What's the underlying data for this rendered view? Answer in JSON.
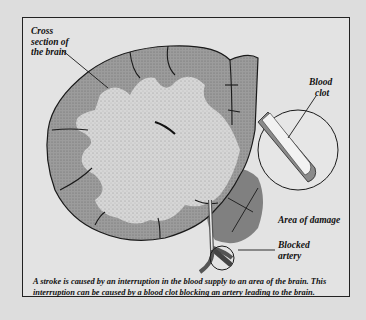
{
  "diagram": {
    "labels": {
      "cross_section_line1": "Cross",
      "cross_section_line2": "section of",
      "cross_section_line3": "the brain",
      "blood_clot_line1": "Blood",
      "blood_clot_line2": "clot",
      "area_of_damage": "Area of damage",
      "blocked_artery_line1": "Blocked",
      "blocked_artery_line2": "artery"
    },
    "caption": "A stroke is caused by an interruption in the blood supply to an area of the brain. This interruption can be caused by a blood clot blocking an artery leading to the brain.",
    "colors": {
      "background": "#dddddd",
      "panel": "#e3e3e3",
      "grey_matter": "#9a9a9a",
      "white_matter": "#d4d4d4",
      "damage": "#6e6e6e",
      "outline": "#1a1a1a"
    }
  }
}
